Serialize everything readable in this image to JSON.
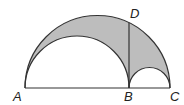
{
  "diagram": {
    "type": "arbelos",
    "points": {
      "A": {
        "label": "A"
      },
      "B": {
        "label": "B"
      },
      "C": {
        "label": "C"
      },
      "D": {
        "label": "D"
      }
    },
    "colors": {
      "shade": "#bdbdbd",
      "stroke": "#333333"
    }
  }
}
